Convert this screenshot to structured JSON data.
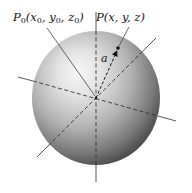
{
  "figure": {
    "labels": {
      "center_point": {
        "symbol": "P",
        "subscript": "0",
        "args": [
          "x",
          "y",
          "z"
        ],
        "arg_subscripts": [
          "0",
          "0",
          "0"
        ],
        "text": "P0(x0, y0, z0)"
      },
      "surface_point": {
        "symbol": "P",
        "args": [
          "x",
          "y",
          "z"
        ],
        "text": "P(x, y, z)"
      },
      "radius": "a"
    },
    "colors": {
      "sphere_highlight": "#f4f4f4",
      "sphere_mid": "#b8b8b8",
      "sphere_shadow": "#4a4a4a",
      "axis_line": "#333333",
      "background": "#ffffff"
    },
    "geometry": {
      "sphere_center": [
        96,
        98
      ],
      "sphere_radius": 65,
      "point_P": [
        118,
        48
      ]
    }
  }
}
